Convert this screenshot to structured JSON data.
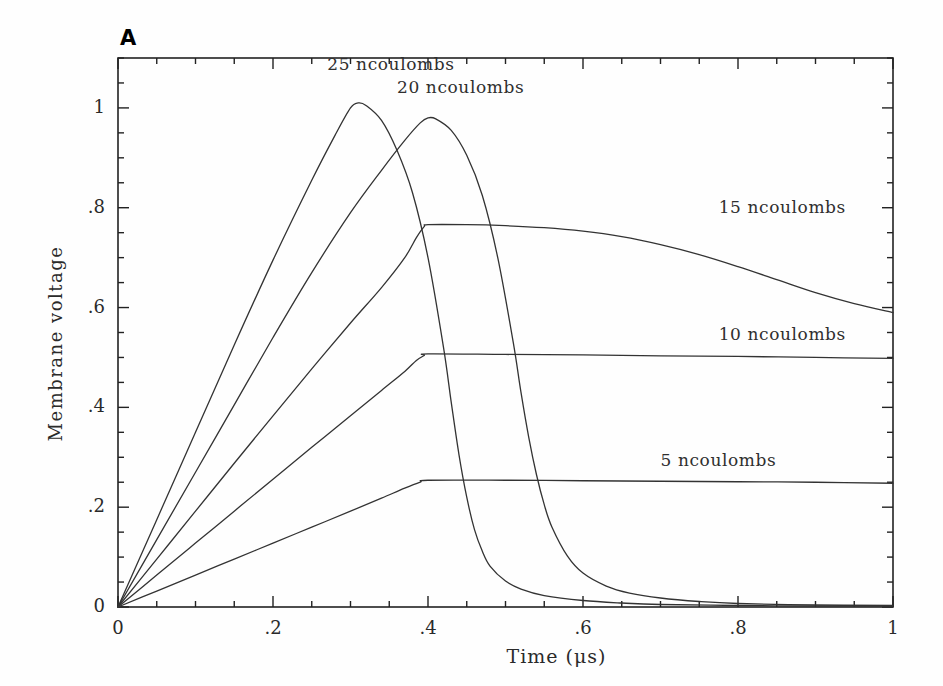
{
  "figure": {
    "panel_label": "A",
    "background_color": "#fefefe",
    "line_color": "#333333",
    "axis_color": "#222222"
  },
  "chart_data": {
    "type": "line",
    "title": "",
    "subtitle": "",
    "xlabel": "Time (μs)",
    "ylabel": "Membrane voltage",
    "xlim": [
      0,
      1
    ],
    "ylim": [
      0,
      1.1
    ],
    "grid": false,
    "legend_position": "inline-annotations",
    "x_ticks": [
      "0",
      ".2",
      ".4",
      ".6",
      ".8",
      "1"
    ],
    "x_tick_values": [
      0,
      0.2,
      0.4,
      0.6,
      0.8,
      1
    ],
    "x_minor_tick_interval": 0.05,
    "y_ticks": [
      "0",
      ".2",
      ".4",
      ".6",
      ".8",
      "1"
    ],
    "y_tick_values": [
      0,
      0.2,
      0.4,
      0.6,
      0.8,
      1
    ],
    "y_minor_tick_interval": 0.05,
    "series": [
      {
        "name": "25 ncoulombs",
        "label": "25 ncoulombs",
        "label_x": 0.27,
        "label_y": 1.085,
        "peak_x": 0.31,
        "peak_y": 1.01,
        "points": [
          [
            0.0,
            0.0
          ],
          [
            0.05,
            0.175
          ],
          [
            0.1,
            0.35
          ],
          [
            0.15,
            0.525
          ],
          [
            0.2,
            0.695
          ],
          [
            0.25,
            0.855
          ],
          [
            0.28,
            0.945
          ],
          [
            0.3,
            1.0
          ],
          [
            0.31,
            1.01
          ],
          [
            0.32,
            1.005
          ],
          [
            0.34,
            0.975
          ],
          [
            0.36,
            0.915
          ],
          [
            0.38,
            0.83
          ],
          [
            0.4,
            0.7
          ],
          [
            0.42,
            0.52
          ],
          [
            0.43,
            0.41
          ],
          [
            0.44,
            0.305
          ],
          [
            0.45,
            0.22
          ],
          [
            0.46,
            0.155
          ],
          [
            0.47,
            0.112
          ],
          [
            0.48,
            0.082
          ],
          [
            0.5,
            0.052
          ],
          [
            0.52,
            0.036
          ],
          [
            0.55,
            0.023
          ],
          [
            0.6,
            0.013
          ],
          [
            0.65,
            0.008
          ],
          [
            0.7,
            0.005
          ],
          [
            0.8,
            0.003
          ],
          [
            0.9,
            0.002
          ],
          [
            1.0,
            0.002
          ]
        ]
      },
      {
        "name": "20 ncoulombs",
        "label": "20 ncoulombs",
        "label_x": 0.36,
        "label_y": 1.04,
        "peak_x": 0.4,
        "peak_y": 0.98,
        "points": [
          [
            0.0,
            0.0
          ],
          [
            0.05,
            0.135
          ],
          [
            0.1,
            0.27
          ],
          [
            0.15,
            0.405
          ],
          [
            0.2,
            0.54
          ],
          [
            0.25,
            0.67
          ],
          [
            0.3,
            0.79
          ],
          [
            0.34,
            0.875
          ],
          [
            0.37,
            0.935
          ],
          [
            0.39,
            0.97
          ],
          [
            0.4,
            0.98
          ],
          [
            0.41,
            0.978
          ],
          [
            0.43,
            0.955
          ],
          [
            0.45,
            0.905
          ],
          [
            0.47,
            0.825
          ],
          [
            0.49,
            0.7
          ],
          [
            0.51,
            0.53
          ],
          [
            0.52,
            0.43
          ],
          [
            0.53,
            0.34
          ],
          [
            0.54,
            0.265
          ],
          [
            0.55,
            0.205
          ],
          [
            0.56,
            0.16
          ],
          [
            0.58,
            0.102
          ],
          [
            0.6,
            0.068
          ],
          [
            0.63,
            0.042
          ],
          [
            0.66,
            0.028
          ],
          [
            0.7,
            0.018
          ],
          [
            0.75,
            0.011
          ],
          [
            0.8,
            0.007
          ],
          [
            0.9,
            0.004
          ],
          [
            1.0,
            0.003
          ]
        ]
      },
      {
        "name": "15 ncoulombs",
        "label": "15 ncoulombs",
        "label_x": 0.775,
        "label_y": 0.8,
        "plateau_y": 0.765,
        "end_y": 0.59,
        "points": [
          [
            0.0,
            0.0
          ],
          [
            0.05,
            0.096
          ],
          [
            0.1,
            0.192
          ],
          [
            0.15,
            0.288
          ],
          [
            0.2,
            0.383
          ],
          [
            0.25,
            0.477
          ],
          [
            0.3,
            0.569
          ],
          [
            0.34,
            0.64
          ],
          [
            0.37,
            0.7
          ],
          [
            0.385,
            0.74
          ],
          [
            0.395,
            0.762
          ],
          [
            0.4,
            0.766
          ],
          [
            0.45,
            0.766
          ],
          [
            0.5,
            0.764
          ],
          [
            0.55,
            0.76
          ],
          [
            0.6,
            0.753
          ],
          [
            0.65,
            0.742
          ],
          [
            0.7,
            0.726
          ],
          [
            0.75,
            0.706
          ],
          [
            0.8,
            0.682
          ],
          [
            0.85,
            0.656
          ],
          [
            0.9,
            0.63
          ],
          [
            0.95,
            0.608
          ],
          [
            1.0,
            0.59
          ]
        ]
      },
      {
        "name": "10 ncoulombs",
        "label": "10 ncoulombs",
        "label_x": 0.775,
        "label_y": 0.545,
        "plateau_y": 0.506,
        "end_y": 0.498,
        "points": [
          [
            0.0,
            0.0
          ],
          [
            0.05,
            0.064
          ],
          [
            0.1,
            0.128
          ],
          [
            0.15,
            0.192
          ],
          [
            0.2,
            0.256
          ],
          [
            0.25,
            0.32
          ],
          [
            0.3,
            0.383
          ],
          [
            0.34,
            0.434
          ],
          [
            0.37,
            0.472
          ],
          [
            0.385,
            0.494
          ],
          [
            0.395,
            0.504
          ],
          [
            0.4,
            0.507
          ],
          [
            0.5,
            0.506
          ],
          [
            0.6,
            0.505
          ],
          [
            0.7,
            0.503
          ],
          [
            0.8,
            0.502
          ],
          [
            0.9,
            0.5
          ],
          [
            1.0,
            0.498
          ]
        ]
      },
      {
        "name": "5 ncoulombs",
        "label": "5 ncoulombs",
        "label_x": 0.7,
        "label_y": 0.292,
        "plateau_y": 0.254,
        "end_y": 0.248,
        "points": [
          [
            0.0,
            0.0
          ],
          [
            0.05,
            0.032
          ],
          [
            0.1,
            0.064
          ],
          [
            0.15,
            0.096
          ],
          [
            0.2,
            0.128
          ],
          [
            0.25,
            0.16
          ],
          [
            0.3,
            0.192
          ],
          [
            0.34,
            0.218
          ],
          [
            0.37,
            0.238
          ],
          [
            0.39,
            0.25
          ],
          [
            0.4,
            0.254
          ],
          [
            0.5,
            0.254
          ],
          [
            0.6,
            0.253
          ],
          [
            0.7,
            0.252
          ],
          [
            0.8,
            0.251
          ],
          [
            0.9,
            0.25
          ],
          [
            1.0,
            0.248
          ]
        ]
      }
    ]
  }
}
